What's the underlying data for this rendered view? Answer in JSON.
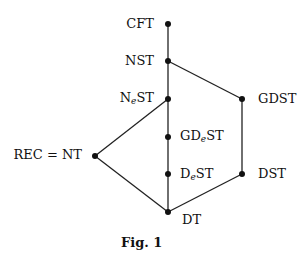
{
  "diagram": {
    "caption": "Fig. 1",
    "nodes": [
      {
        "id": "CFT",
        "label": "CFT",
        "x": 168,
        "y": 24,
        "label_side": "left"
      },
      {
        "id": "NST",
        "label": "NST",
        "x": 168,
        "y": 61,
        "label_side": "left"
      },
      {
        "id": "NeST",
        "label_main": "N",
        "label_sub": "e",
        "label_rest": "ST",
        "x": 168,
        "y": 99,
        "label_side": "left"
      },
      {
        "id": "GDST",
        "label": "GDST",
        "x": 242,
        "y": 99,
        "label_side": "right"
      },
      {
        "id": "GDeST",
        "label_main": "GD",
        "label_sub": "e",
        "label_rest": "ST",
        "x": 168,
        "y": 137,
        "label_side": "right"
      },
      {
        "id": "REC",
        "label": "REC = NT",
        "x": 95,
        "y": 156,
        "label_side": "left"
      },
      {
        "id": "DeST",
        "label_main": "D",
        "label_sub": "e",
        "label_rest": "ST",
        "x": 168,
        "y": 174,
        "label_side": "right"
      },
      {
        "id": "DST",
        "label": "DST",
        "x": 242,
        "y": 174,
        "label_side": "right"
      },
      {
        "id": "DT",
        "label": "DT",
        "x": 168,
        "y": 212,
        "label_side": "right"
      }
    ],
    "edges": [
      [
        "CFT",
        "NST"
      ],
      [
        "NST",
        "NeST"
      ],
      [
        "NST",
        "GDST"
      ],
      [
        "NeST",
        "GDeST"
      ],
      [
        "NeST",
        "REC"
      ],
      [
        "GDeST",
        "DeST"
      ],
      [
        "DeST",
        "DT"
      ],
      [
        "GDST",
        "DST"
      ],
      [
        "DST",
        "DT"
      ],
      [
        "REC",
        "DT"
      ]
    ]
  }
}
